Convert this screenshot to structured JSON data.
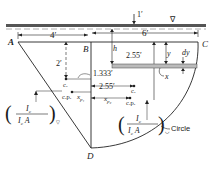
{
  "diagram": {
    "type": "hydrostatic plane surface figure",
    "surface_symbol": "∇",
    "points": {
      "A": "A",
      "B": "B",
      "C": "C",
      "D": "D"
    },
    "dimensions": {
      "top_depth": "1′",
      "width_left": "4′",
      "width_right": "6′",
      "depth_left_centroid": "2′",
      "depth_right_centroid": "2.55′",
      "offset_1": "1.333′",
      "offset_2": "2.55′"
    },
    "variables": {
      "h": "h",
      "y": "y",
      "dy": "dy",
      "x": "x",
      "xp1": "x",
      "xp1_sub": "p₁",
      "xp2": "x",
      "xp2_sub": "p₂"
    },
    "markers": {
      "c1": "c.",
      "cp1": "c.p.",
      "c2": "c.",
      "cp2": "c.p."
    },
    "formulas": {
      "left_num": "I",
      "left_num_sub": "c",
      "left_den": "I",
      "left_den_sub": "c",
      "left_den_A": "A",
      "left_tag": "▽",
      "right_num": "I",
      "right_num_sub": "c",
      "right_den": "I",
      "right_den_sub": "c",
      "right_den_A": "A",
      "right_tag": "◡"
    },
    "callouts": {
      "circle": "Circle"
    }
  }
}
